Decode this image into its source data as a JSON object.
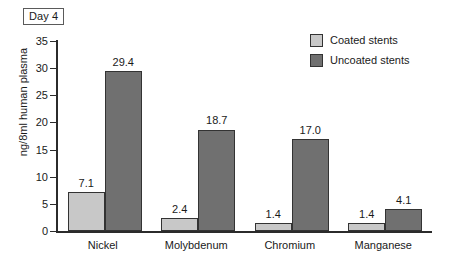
{
  "badge": {
    "label": "Day 4"
  },
  "legend": {
    "position": "top-right",
    "items": [
      {
        "label": "Coated stents",
        "color": "#c8c8c8",
        "swatch_name": "legend-swatch-coated"
      },
      {
        "label": "Uncoated stents",
        "color": "#707070",
        "swatch_name": "legend-swatch-uncoated"
      }
    ]
  },
  "chart_data": {
    "type": "bar",
    "title": "Day 4",
    "xlabel": "",
    "ylabel": "ng/8ml human plasma",
    "ylim": [
      0,
      35
    ],
    "yticks": [
      0,
      5,
      10,
      15,
      20,
      25,
      30,
      35
    ],
    "ytick_labels": [
      "0",
      "5",
      "10",
      "15",
      "20",
      "25",
      "30",
      "35"
    ],
    "grid": false,
    "legend_position": "top-right",
    "categories": [
      "Nickel",
      "Molybdenum",
      "Chromium",
      "Manganese"
    ],
    "series": [
      {
        "name": "Coated stents",
        "color": "#c8c8c8",
        "values": [
          7.1,
          2.4,
          1.4,
          1.4
        ],
        "labels": [
          "7.1",
          "2.4",
          "1.4",
          "1.4"
        ]
      },
      {
        "name": "Uncoated stents",
        "color": "#707070",
        "values": [
          29.4,
          18.7,
          17.0,
          4.1
        ],
        "labels": [
          "29.4",
          "18.7",
          "17.0",
          "4.1"
        ]
      }
    ]
  }
}
